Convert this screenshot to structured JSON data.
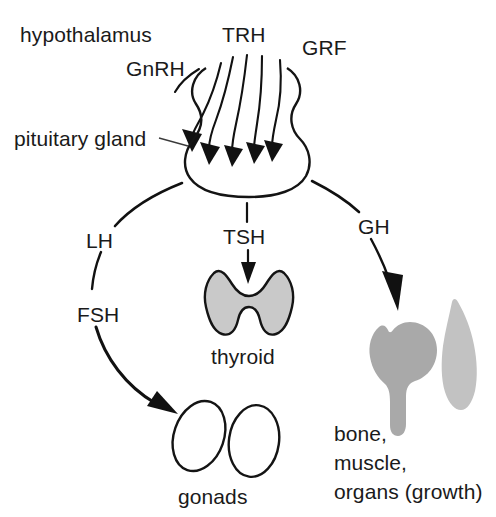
{
  "figure": {
    "background_color": "#ffffff",
    "ink_color": "#111111"
  },
  "labels": {
    "hypothalamus": "hypothalamus",
    "pituitary_gland": "pituitary  gland",
    "gnrh": "GnRH",
    "trh": "TRH",
    "grf": "GRF",
    "lh": "LH",
    "fsh": "FSH",
    "tsh": "TSH",
    "gh": "GH",
    "thyroid": "thyroid",
    "gonads": "gonads",
    "targets_line1": "bone,",
    "targets_line2": "muscle,",
    "targets_line3": "organs  (growth)"
  },
  "structures": {
    "pituitary": {
      "name": "pituitary-gland",
      "fill": "none",
      "stroke": "#111111"
    },
    "thyroid": {
      "name": "thyroid-gland",
      "fill": "#c9c9c9",
      "stroke": "#141414"
    },
    "gonads": {
      "name": "gonads",
      "count": 2,
      "fill": "none",
      "stroke": "#141414"
    },
    "bone": {
      "name": "femur-bone",
      "fill": "#a9a9a9",
      "stroke": "none"
    },
    "muscle": {
      "name": "muscle",
      "fill": "#c2c2c2",
      "stroke": "none"
    }
  },
  "hypothalamic_hormones": [
    {
      "abbr": "GnRH",
      "full": "gonadotropin-releasing hormone"
    },
    {
      "abbr": "TRH",
      "full": "thyrotropin-releasing hormone"
    },
    {
      "abbr": "GRF",
      "full": "growth hormone-releasing factor"
    }
  ],
  "pituitary_hormones": [
    {
      "abbr": "LH",
      "target": "gonads"
    },
    {
      "abbr": "FSH",
      "target": "gonads"
    },
    {
      "abbr": "TSH",
      "target": "thyroid"
    },
    {
      "abbr": "GH",
      "target": "bone, muscle, organs (growth)"
    }
  ],
  "nerve_fibers": {
    "count": 5,
    "direction": "down-into-pituitary"
  }
}
